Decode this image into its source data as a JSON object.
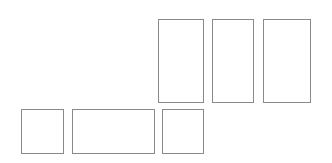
{
  "figure": {
    "background_color": "#ffffff",
    "stroke_color": "#8a8a8a",
    "fill_color": "#ffffff",
    "stroke_width": 1,
    "width": 332,
    "height": 163
  },
  "shapes": [
    {
      "name": "top-rectangle-1",
      "label": "",
      "role": "tall-rectangle",
      "row": "top",
      "index": 1,
      "x": 158,
      "y": 19,
      "width": 46,
      "height": 84
    },
    {
      "name": "top-rectangle-2",
      "label": "",
      "role": "tall-rectangle",
      "row": "top",
      "index": 2,
      "x": 212,
      "y": 19,
      "width": 42,
      "height": 84
    },
    {
      "name": "top-rectangle-3",
      "label": "",
      "role": "tall-rectangle",
      "row": "top",
      "index": 3,
      "x": 263,
      "y": 19,
      "width": 48,
      "height": 84
    },
    {
      "name": "bottom-rectangle-1",
      "label": "",
      "role": "square",
      "row": "bottom",
      "index": 1,
      "x": 21,
      "y": 109,
      "width": 43,
      "height": 45
    },
    {
      "name": "bottom-rectangle-2",
      "label": "",
      "role": "wide-rectangle",
      "row": "bottom",
      "index": 2,
      "x": 72,
      "y": 109,
      "width": 83,
      "height": 45
    },
    {
      "name": "bottom-rectangle-3",
      "label": "",
      "role": "square",
      "row": "bottom",
      "index": 3,
      "x": 162,
      "y": 109,
      "width": 42,
      "height": 45
    }
  ]
}
